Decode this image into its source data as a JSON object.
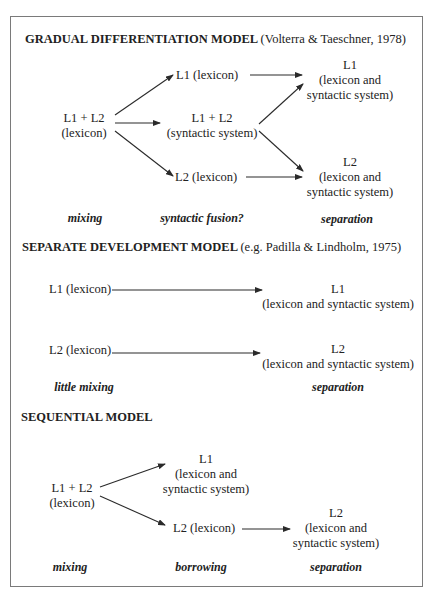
{
  "sections": [
    {
      "title": "GRADUAL DIFFERENTIATION MODEL",
      "citation": "(Volterra & Taeschner, 1978)",
      "nodes": {
        "start_line1": "L1 + L2",
        "start_line2": "(lexicon)",
        "mid_top": "L1 (lexicon)",
        "mid_center_line1": "L1 + L2",
        "mid_center_line2": "(syntactic system)",
        "mid_bottom": "L2 (lexicon)",
        "end_top_line1": "L1",
        "end_top_line2": "(lexicon and",
        "end_top_line3": "syntactic system)",
        "end_bottom_line1": "L2",
        "end_bottom_line2": "(lexicon and",
        "end_bottom_line3": "syntactic system)"
      },
      "stages": [
        "mixing",
        "syntactic fusion?",
        "separation"
      ]
    },
    {
      "title": "SEPARATE DEVELOPMENT MODEL",
      "citation": "(e.g. Padilla & Lindholm, 1975)",
      "nodes": {
        "start_top": "L1 (lexicon)",
        "start_bottom": "L2 (lexicon)",
        "end_top_line1": "L1",
        "end_top_line2": "(lexicon and syntactic system)",
        "end_bottom_line1": "L2",
        "end_bottom_line2": "(lexicon and syntactic system)"
      },
      "stages": [
        "little mixing",
        "separation"
      ]
    },
    {
      "title": "SEQUENTIAL MODEL",
      "nodes": {
        "start_line1": "L1 + L2",
        "start_line2": "(lexicon)",
        "mid_top_line1": "L1",
        "mid_top_line2": "(lexicon and",
        "mid_top_line3": "syntactic system)",
        "mid_bottom": "L2 (lexicon)",
        "end_line1": "L2",
        "end_line2": "(lexicon and",
        "end_line3": "syntactic system)"
      },
      "stages": [
        "mixing",
        "borrowing",
        "separation"
      ]
    }
  ],
  "colors": {
    "border": "#7a7a7a",
    "text": "#222222",
    "arrow": "#2a2a2a"
  }
}
